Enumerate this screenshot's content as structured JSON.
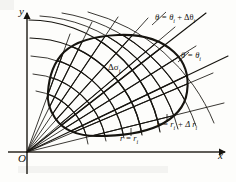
{
  "figure": {
    "kind": "polar-coordinate-partition-diagram",
    "background_color": "#fdfdfb",
    "ink_color": "#16140f",
    "axes": {
      "x_label": "x",
      "y_label": "y",
      "origin_label": "O",
      "x_axis": {
        "y": 152,
        "x_start": 8,
        "x_end": 228,
        "arrow": true
      },
      "y_axis": {
        "x": 27,
        "y_start": 174,
        "y_end": 10,
        "arrow": true
      }
    },
    "labels": {
      "theta_outer": {
        "text": "θ = θ",
        "sub1": "i",
        "plus": " + Δθ",
        "sub2": "i"
      },
      "theta_inner": {
        "text": "θ = θ",
        "sub1": "i"
      },
      "r_outer": {
        "text": "r = r",
        "sub1": "i",
        "plus": " + Δ r",
        "sub2": "i"
      },
      "r_inner": {
        "text": "r = r",
        "sub1": "i"
      },
      "area_element": {
        "text": "Δσ",
        "sub1": "i"
      }
    },
    "polar_grid": {
      "origin": [
        27,
        152
      ],
      "ray_angles_deg": [
        14,
        23,
        32,
        41,
        50,
        59,
        68,
        77,
        86
      ],
      "highlighted_rays": {
        "theta_i_index": 4,
        "theta_i_plus_index": 6
      },
      "arc_radii": [
        60,
        78,
        96,
        114,
        132,
        150,
        168,
        186
      ],
      "highlighted_arcs": {
        "r_i_index": 3,
        "r_i_plus_index": 4
      },
      "arc_angle_span_deg": [
        10,
        90
      ]
    },
    "region_boundary": {
      "description": "closed smooth blob region subdivided by the polar grid",
      "points": [
        [
          48,
          92
        ],
        [
          50,
          72
        ],
        [
          60,
          55
        ],
        [
          78,
          43
        ],
        [
          100,
          37
        ],
        [
          124,
          35
        ],
        [
          146,
          38
        ],
        [
          164,
          47
        ],
        [
          178,
          60
        ],
        [
          186,
          76
        ],
        [
          188,
          92
        ],
        [
          182,
          107
        ],
        [
          168,
          120
        ],
        [
          148,
          130
        ],
        [
          124,
          135
        ],
        [
          100,
          136
        ],
        [
          78,
          132
        ],
        [
          62,
          122
        ],
        [
          52,
          108
        ]
      ]
    }
  }
}
